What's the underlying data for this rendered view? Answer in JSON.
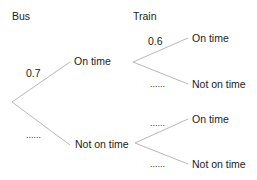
{
  "diagram": {
    "type": "probability-tree",
    "headers": {
      "stage1": "Bus",
      "stage2": "Train"
    },
    "stage1": {
      "branches": [
        {
          "outcome": "On time",
          "probability": "0.7"
        },
        {
          "outcome": "Not on time",
          "probability": "......"
        }
      ]
    },
    "stage2": {
      "after_on_time": [
        {
          "outcome": "On time",
          "probability": "0.6"
        },
        {
          "outcome": "Not on time",
          "probability": "......"
        }
      ],
      "after_not_on_time": [
        {
          "outcome": "On time",
          "probability": "......"
        },
        {
          "outcome": "Not on time",
          "probability": "......"
        }
      ]
    },
    "line_color": "#b8b8b8"
  }
}
